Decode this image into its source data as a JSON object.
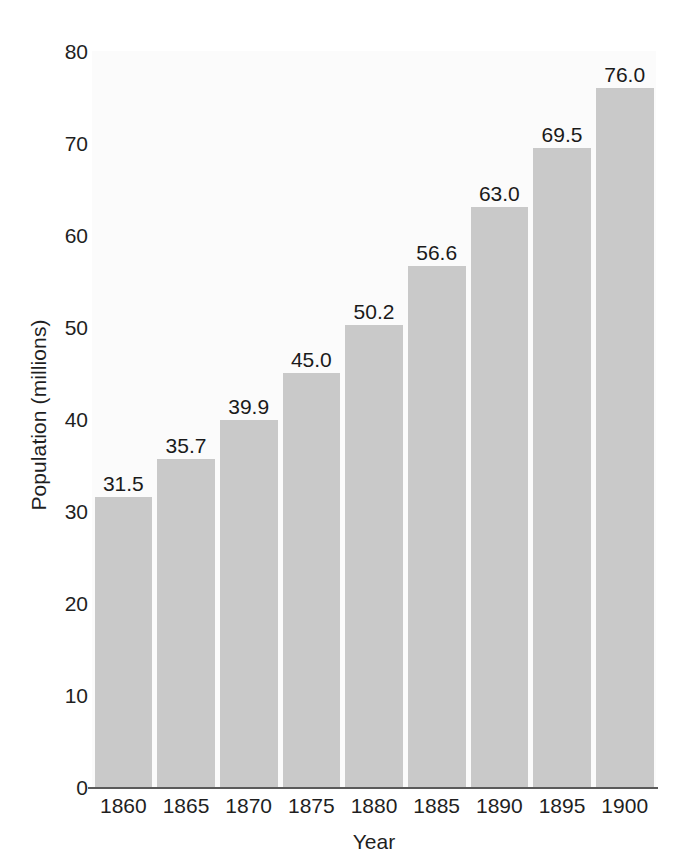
{
  "chart_data": {
    "type": "bar",
    "title": "",
    "xlabel": "Year",
    "ylabel": "Population (millions)",
    "categories": [
      "1860",
      "1865",
      "1870",
      "1875",
      "1880",
      "1885",
      "1890",
      "1895",
      "1900"
    ],
    "values": [
      31.5,
      35.7,
      39.9,
      45.0,
      50.2,
      56.6,
      63.0,
      69.5,
      76.0
    ],
    "value_labels": [
      "31.5",
      "35.7",
      "39.9",
      "45.0",
      "50.2",
      "56.6",
      "63.0",
      "69.5",
      "76.0"
    ],
    "ylim": [
      0,
      80
    ],
    "yticks": [
      0,
      10,
      20,
      30,
      40,
      50,
      60,
      70,
      80
    ],
    "ytick_labels": [
      "0",
      "10",
      "20",
      "30",
      "40",
      "50",
      "60",
      "70",
      "80"
    ],
    "grid": false,
    "legend": false,
    "bar_color": "#c9c9c9",
    "plot_background": "#fbfbfb",
    "axis_color": "#5a5a5a",
    "text_color": "#1f1f1f"
  }
}
